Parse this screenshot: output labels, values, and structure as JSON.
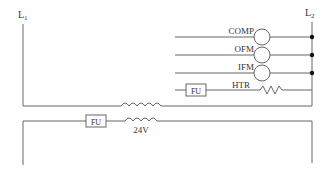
{
  "diagram": {
    "lines": {
      "left": "L",
      "left_sub": "1",
      "right": "L",
      "right_sub": "2"
    },
    "loads": [
      {
        "label": "COMP",
        "symbol": "coil"
      },
      {
        "label": "OFM",
        "symbol": "coil"
      },
      {
        "label": "IFM",
        "symbol": "coil"
      },
      {
        "label": "HTR",
        "symbol": "resistor",
        "fuse": "FU"
      }
    ],
    "transformer": {
      "secondary_voltage": "24V"
    },
    "secondary_fuse": "FU",
    "colors": {
      "line": "#666666",
      "text": "#333333",
      "dot": "#111111"
    }
  }
}
